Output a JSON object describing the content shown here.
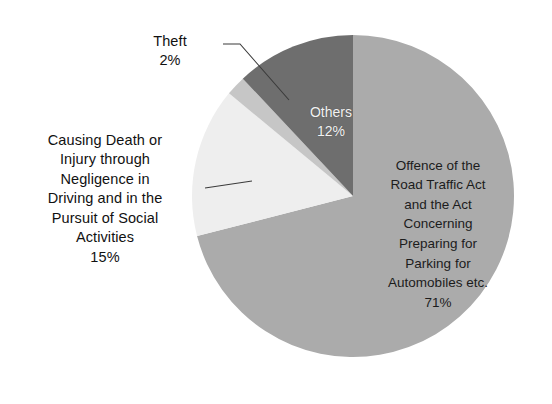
{
  "figure": {
    "background_color": "#ffffff",
    "width": 552,
    "height": 404
  },
  "chart_data": {
    "type": "pie",
    "title": "",
    "subtitle": "",
    "xlabel": "",
    "ylabel": "",
    "grid": false,
    "legend": "none",
    "label_placement": "mixed-inside-and-callout",
    "start_angle_deg": 90,
    "direction": "counterclockwise",
    "total_percent": 100,
    "categories": [
      "Others",
      "Theft",
      "Causing Death or Injury through Negligence in Driving and in the Pursuit of Social Activities",
      "Offence of the Road Traffic Act and the Act Concerning Preparing for Parking for Automobiles etc."
    ],
    "values": [
      12,
      2,
      15,
      71
    ],
    "colors": [
      "#6e6e6e",
      "#c6c6c6",
      "#eeeeee",
      "#ababab"
    ],
    "slices": [
      {
        "name": "Others",
        "value": 12,
        "percent_label": "12%",
        "color": "#6e6e6e",
        "label_text": "Others",
        "label_position": "inside",
        "label_color": "#f2f2f2",
        "start_deg": 90,
        "end_deg": 133.2
      },
      {
        "name": "Theft",
        "value": 2,
        "percent_label": "2%",
        "color": "#c6c6c6",
        "label_text": "Theft",
        "label_position": "callout",
        "label_color": "#111111",
        "start_deg": 133.2,
        "end_deg": 140.4
      },
      {
        "name": "Causing Death or Injury through Negligence in Driving and in the Pursuit of Social Activities",
        "value": 15,
        "percent_label": "15%",
        "color": "#eeeeee",
        "label_text": "Causing Death or\nInjury through\nNegligence in\nDriving and in the\nPursuit of Social\nActivities",
        "label_position": "callout",
        "label_color": "#111111",
        "start_deg": 140.4,
        "end_deg": 194.4
      },
      {
        "name": "Offence of the Road Traffic Act and the Act Concerning Preparing for Parking for Automobiles etc.",
        "value": 71,
        "percent_label": "71%",
        "color": "#ababab",
        "label_text": "Offence of the\nRoad Traffic Act\nand the Act\nConcerning\nPreparing for\nParking for\nAutomobiles etc.",
        "label_position": "inside",
        "label_color": "#1c1c1c",
        "start_deg": 194.4,
        "end_deg": 450
      }
    ]
  },
  "labels": {
    "theft": {
      "text": "Theft",
      "percent": "2%"
    },
    "negligence": {
      "text": "Causing Death or\nInjury through\nNegligence in\nDriving and in the\nPursuit of Social\nActivities",
      "percent": "15%"
    },
    "others": {
      "text": "Others",
      "percent": "12%"
    },
    "road_traffic": {
      "text": "Offence of the\nRoad Traffic Act\nand the Act\nConcerning\nPreparing for\nParking for\nAutomobiles etc.",
      "percent": "71%"
    }
  },
  "geometry": {
    "center_x": 353,
    "center_y": 196,
    "radius": 161,
    "leader_theft": "M 223 44 L 239 44 L 290 101",
    "leader_negligence": "M 206 188 L 250 180"
  }
}
